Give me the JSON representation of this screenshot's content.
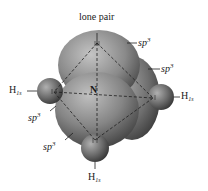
{
  "diagram": {
    "title": "lone pair",
    "center_atom": "N",
    "orbital_labels": [
      {
        "id": "sp3-top-right",
        "base": "sp",
        "sup": "3"
      },
      {
        "id": "sp3-right",
        "base": "sp",
        "sup": "3"
      },
      {
        "id": "sp3-left-upper",
        "base": "sp",
        "sup": "3"
      },
      {
        "id": "sp3-left-lower",
        "base": "sp",
        "sup": "3"
      }
    ],
    "hydrogen_labels": [
      {
        "id": "h-left",
        "base": "H",
        "sub": "1s"
      },
      {
        "id": "h-right",
        "base": "H",
        "sub": "1s"
      },
      {
        "id": "h-bottom",
        "base": "H",
        "sub": "1s"
      }
    ],
    "colors": {
      "lobe_light": "#b8b8b8",
      "lobe_dark": "#4a4a4a",
      "line": "#222222"
    }
  }
}
